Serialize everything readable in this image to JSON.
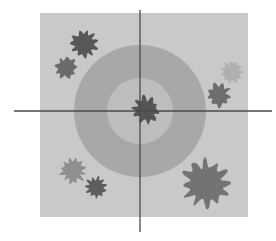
{
  "figure": {
    "title": "",
    "canvas": {
      "width": 276,
      "height": 241,
      "background": "#ffffff"
    },
    "panel": {
      "label": "plot-panel",
      "x": 40,
      "y": 13,
      "width": 208,
      "height": 204,
      "fill": "#c9c9c9"
    },
    "axes": {
      "label": "crosshair-axes",
      "color": "#4a4a4a",
      "stroke_width": 1.3,
      "horizontal": {
        "x1": 14,
        "x2": 272,
        "y": 111
      },
      "vertical": {
        "y1": 10,
        "y2": 232,
        "x": 140
      },
      "origin": {
        "x": 140,
        "y": 111
      }
    },
    "zones": {
      "label": "concentric-zones",
      "center": {
        "x": 140,
        "y": 111
      },
      "rings": [
        {
          "name": "outer-zone",
          "radius": 66,
          "fill": "#a8a8a8"
        },
        {
          "name": "inner-zone",
          "radius": 33,
          "fill": "#bdbdbd"
        }
      ]
    },
    "clusters": [
      {
        "name": "cluster-top-left",
        "cx": 84,
        "cy": 44,
        "r": 15.0,
        "fill": "#585858",
        "seed": 11
      },
      {
        "name": "cluster-upper-left",
        "cx": 66,
        "cy": 68,
        "r": 12.0,
        "fill": "#6b6b6b",
        "seed": 23
      },
      {
        "name": "cluster-upper-right",
        "cx": 232,
        "cy": 72,
        "r": 12.0,
        "fill": "#b0b0b0",
        "seed": 37
      },
      {
        "name": "cluster-right",
        "cx": 219,
        "cy": 95,
        "r": 13.0,
        "fill": "#6e6e6e",
        "seed": 52
      },
      {
        "name": "cluster-center",
        "cx": 146,
        "cy": 110,
        "r": 15.0,
        "fill": "#555555",
        "seed": 68
      },
      {
        "name": "cluster-lower-left-light",
        "cx": 73,
        "cy": 171,
        "r": 14.0,
        "fill": "#8f8f8f",
        "seed": 81
      },
      {
        "name": "cluster-lower-left-dark",
        "cx": 96,
        "cy": 187,
        "r": 11.5,
        "fill": "#5e5e5e",
        "seed": 95
      },
      {
        "name": "cluster-bottom-right",
        "cx": 206,
        "cy": 184,
        "r": 26.0,
        "fill": "#737373",
        "seed": 107
      }
    ]
  },
  "chart_data": {
    "type": "scatter",
    "title": "",
    "xlabel": "",
    "ylabel": "",
    "grid": false,
    "legend": "none",
    "axis_origin": {
      "x": 0,
      "y": 0
    },
    "zone_radii": [
      66,
      33
    ],
    "zone_shades": [
      "#a8a8a8",
      "#bdbdbd"
    ],
    "points": [
      {
        "label": "cluster-top-left",
        "x": -56,
        "y": 67,
        "size": 15.0,
        "shade": "#585858"
      },
      {
        "label": "cluster-upper-left",
        "x": -74,
        "y": 43,
        "size": 12.0,
        "shade": "#6b6b6b"
      },
      {
        "label": "cluster-upper-right",
        "x": 92,
        "y": 39,
        "size": 12.0,
        "shade": "#b0b0b0"
      },
      {
        "label": "cluster-right",
        "x": 79,
        "y": 16,
        "size": 13.0,
        "shade": "#6e6e6e"
      },
      {
        "label": "cluster-center",
        "x": 6,
        "y": 1,
        "size": 15.0,
        "shade": "#555555"
      },
      {
        "label": "cluster-lower-left-light",
        "x": -67,
        "y": -60,
        "size": 14.0,
        "shade": "#8f8f8f"
      },
      {
        "label": "cluster-lower-left-dark",
        "x": -44,
        "y": -76,
        "size": 11.5,
        "shade": "#5e5e5e"
      },
      {
        "label": "cluster-bottom-right",
        "x": 66,
        "y": -73,
        "size": 26.0,
        "shade": "#737373"
      }
    ],
    "xlim": [
      -100,
      108
    ],
    "ylim": [
      -106,
      98
    ]
  }
}
